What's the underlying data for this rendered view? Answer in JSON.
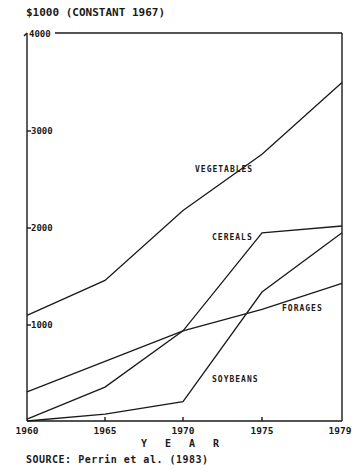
{
  "chart_data": {
    "type": "line",
    "title": "$1000 (CONSTANT 1967)",
    "xlabel": "YEAR",
    "ylabel": "$1000 (CONSTANT 1967)",
    "x": [
      1960,
      1965,
      1970,
      1975,
      1979
    ],
    "x_tick_labels": [
      "1960",
      "1965",
      "1970",
      "1975",
      "1979"
    ],
    "y_ticks": [
      1000,
      2000,
      3000,
      4000
    ],
    "y_tick_labels": [
      "1000",
      "2000",
      "3000",
      "4000"
    ],
    "ylim": [
      0,
      4000
    ],
    "grid": false,
    "legend": "inline labels",
    "series": [
      {
        "name": "VEGETABLES",
        "values": [
          1090,
          1450,
          2170,
          2750,
          3490
        ]
      },
      {
        "name": "CEREALS",
        "values": [
          20,
          350,
          930,
          1940,
          2010
        ]
      },
      {
        "name": "FORAGES",
        "values": [
          300,
          615,
          930,
          1150,
          1420
        ]
      },
      {
        "name": "SOYBEANS",
        "values": [
          0,
          70,
          200,
          1330,
          1940
        ]
      }
    ],
    "annotations": [
      "SOURCE: Perrin et al. (1983)"
    ]
  },
  "labels": {
    "title": "$1000 (CONSTANT 1967)",
    "xlabel": "Y E A R",
    "source": "SOURCE: Perrin et al. (1983)",
    "y4000": "4000",
    "y3000": "3000",
    "y2000": "2000",
    "y1000": "1000",
    "x1960": "1960",
    "x1965": "1965",
    "x1970": "1970",
    "x1975": "1975",
    "x1979": "1979",
    "vegetables": "VEGETABLES",
    "cereals": "CEREALS",
    "forages": "FORAGES",
    "soybeans": "SOYBEANS"
  }
}
